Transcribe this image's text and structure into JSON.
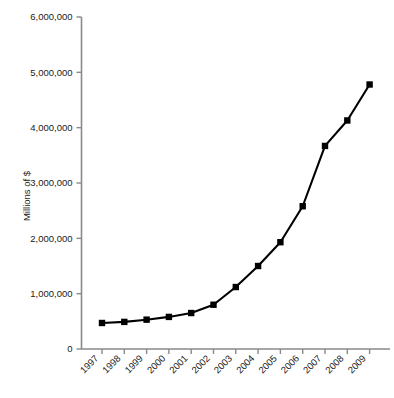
{
  "chart_data": {
    "type": "line",
    "title": "",
    "subtitle": "",
    "xlabel": "",
    "ylabel": "Millions of $",
    "categories": [
      "1997",
      "1998",
      "1999",
      "2000",
      "2001",
      "2002",
      "2003",
      "2004",
      "2005",
      "2006",
      "2007",
      "2008",
      "2009"
    ],
    "values": [
      470000,
      490000,
      530000,
      580000,
      650000,
      800000,
      1120000,
      1500000,
      1930000,
      2580000,
      3670000,
      4130000,
      4780000
    ],
    "series": [
      {
        "name": "Millions of $",
        "values": [
          470000,
          490000,
          530000,
          580000,
          650000,
          800000,
          1120000,
          1500000,
          1930000,
          2580000,
          3670000,
          4130000,
          4780000
        ]
      }
    ],
    "ylim": [
      0,
      6000000
    ],
    "ytick_values": [
      0,
      1000000,
      2000000,
      3000000,
      4000000,
      5000000,
      6000000
    ],
    "ytick_labels": [
      "0",
      "1,000,000",
      "2,000,000",
      "3,000,000",
      "4,000,000",
      "5,000,000",
      "6,000,000"
    ],
    "grid": false,
    "legend": "none",
    "marker": "filled-square",
    "line_color": "#000000",
    "marker_color": "#000000",
    "axis_color": "#7a7a7a",
    "background_color": "#ffffff"
  },
  "axes": {
    "y_axis_title": "Millions of $",
    "x_axis_title": ""
  }
}
